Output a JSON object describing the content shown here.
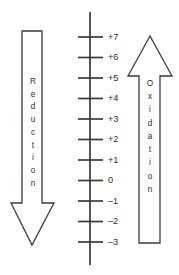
{
  "figure": {
    "background_color": "#ffffff",
    "line_color": "#3a3a3a",
    "text_color": "#2e2e2e"
  },
  "scale": {
    "name": "oxidation-number-axis",
    "axis_orientation": "vertical",
    "axis_x": 90,
    "axis_top_y": 12,
    "axis_bottom_y": 265,
    "tick_left_x": 78,
    "tick_right_x": 103,
    "label_x": 108,
    "tick_spacing_px": 20.5,
    "first_tick_y": 37,
    "labels": [
      "+7",
      "+6",
      "+5",
      "+4",
      "+3",
      "+2",
      "+1",
      "0",
      "–1",
      "–2",
      "–3"
    ],
    "values": [
      7,
      6,
      5,
      4,
      3,
      2,
      1,
      0,
      -1,
      -2,
      -3
    ]
  },
  "left_arrow": {
    "label": "Reduction",
    "letters": [
      "R",
      "e",
      "d",
      "u",
      "c",
      "t",
      "i",
      "o",
      "n"
    ],
    "direction": "down",
    "points": "22,31 42,31 42,203 54,203 32,245 11,203 22,203"
  },
  "right_arrow": {
    "label": "Oxidation",
    "letters": [
      "O",
      "x",
      "i",
      "d",
      "a",
      "t",
      "i",
      "o",
      "n"
    ],
    "direction": "up",
    "points": "150,36 172,76 160,76 160,243 139,243 139,76 128,76"
  }
}
